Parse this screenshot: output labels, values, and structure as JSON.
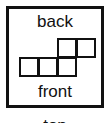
{
  "labels": {
    "back": "back",
    "front": "front",
    "top": "top"
  },
  "grid": {
    "description": "staircase of unit squares viewed from top",
    "bottom_row_cells": 3,
    "top_row_cells": 2,
    "line_color": "#111111"
  }
}
